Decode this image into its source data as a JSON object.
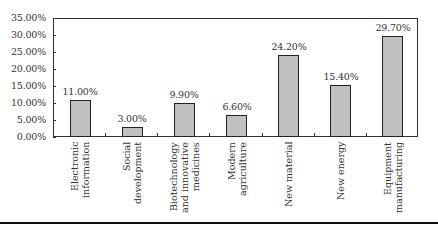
{
  "chart_data": {
    "type": "bar",
    "title": "",
    "xlabel": "",
    "ylabel": "",
    "ylim": [
      0,
      35
    ],
    "yticks": [
      "0.00%",
      "5.00%",
      "10.00%",
      "15.00%",
      "20.00%",
      "25.00%",
      "30.00%",
      "35.00%"
    ],
    "grid": false,
    "legend": null,
    "categories": [
      "Electronic information",
      "Social development",
      "Biotechnology and innovative medicines",
      "Modern agriculture",
      "New material",
      "New energy",
      "Equipment manufacturing"
    ],
    "category_label_lines": [
      "Electronic\ninformation",
      "Social\ndevelopment",
      "Biotechnology\nand innovative\nmedicines",
      "Modern\nagriculture",
      "New material",
      "New energy",
      "Equipment\nmanufacturing"
    ],
    "values": [
      11.0,
      3.0,
      9.9,
      6.6,
      24.2,
      15.4,
      29.7
    ],
    "value_labels": [
      "11.00%",
      "3.00%",
      "9.90%",
      "6.60%",
      "24.20%",
      "15.40%",
      "29.70%"
    ],
    "colors": {
      "bar_fill": "#c0c0c0",
      "bar_edge": "#222222",
      "axis": "#333333"
    }
  }
}
